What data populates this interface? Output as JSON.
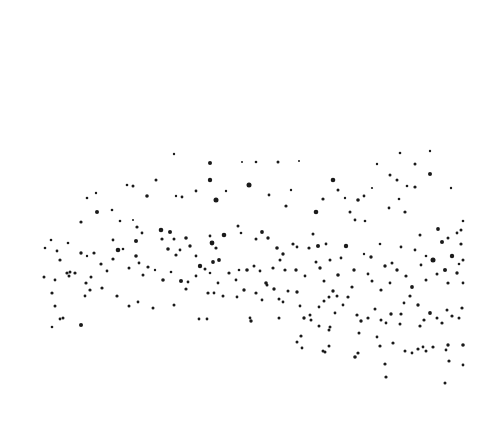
{
  "image": {
    "width": 482,
    "height": 431,
    "background": "#ffffff",
    "dot_color": "#1a1a1a",
    "description": "Scattered black dots forming an arched band across a white field"
  },
  "dots": [
    [
      174,
      154,
      1.2
    ],
    [
      210,
      163,
      2
    ],
    [
      242,
      162,
      1
    ],
    [
      256,
      162,
      1.3
    ],
    [
      278,
      162,
      1.5
    ],
    [
      299,
      161,
      1
    ],
    [
      210,
      180,
      2.2
    ],
    [
      249,
      185,
      2.5
    ],
    [
      226,
      191,
      1.2
    ],
    [
      156,
      180,
      1.5
    ],
    [
      127,
      185,
      1.3
    ],
    [
      133,
      186,
      1.5
    ],
    [
      147,
      196,
      1.8
    ],
    [
      176,
      196,
      1.2
    ],
    [
      182,
      197,
      1.4
    ],
    [
      216,
      200,
      2.5
    ],
    [
      269,
      195,
      1.4
    ],
    [
      291,
      190,
      1.2
    ],
    [
      196,
      191,
      1.4
    ],
    [
      286,
      206,
      1.6
    ],
    [
      316,
      212,
      2.3
    ],
    [
      323,
      199,
      1.6
    ],
    [
      358,
      200,
      1.8
    ],
    [
      389,
      208,
      1.4
    ],
    [
      399,
      199,
      1.3
    ],
    [
      405,
      212,
      1.6
    ],
    [
      415,
      187,
      1.6
    ],
    [
      397,
      180,
      1.5
    ],
    [
      390,
      175,
      1.5
    ],
    [
      415,
      164,
      1.5
    ],
    [
      430,
      174,
      2
    ],
    [
      451,
      188,
      1.2
    ],
    [
      463,
      221,
      1.3
    ],
    [
      461,
      230,
      1.5
    ],
    [
      372,
      188,
      1.1
    ],
    [
      364,
      196,
      1.4
    ],
    [
      350,
      212,
      1.5
    ],
    [
      355,
      220,
      1.4
    ],
    [
      365,
      221,
      1.3
    ],
    [
      333,
      180,
      2.3
    ],
    [
      338,
      190,
      1.5
    ],
    [
      345,
      198,
      1.2
    ],
    [
      400,
      153,
      1.3
    ],
    [
      407,
      186,
      1.3
    ],
    [
      430,
      151,
      1.2
    ],
    [
      377,
      164,
      1.2
    ],
    [
      96,
      193,
      1.2
    ],
    [
      87,
      198,
      1.3
    ],
    [
      97,
      212,
      2
    ],
    [
      81,
      222,
      1.6
    ],
    [
      68,
      243,
      1.3
    ],
    [
      51,
      240,
      1.3
    ],
    [
      45,
      248,
      1.3
    ],
    [
      57,
      251,
      1.4
    ],
    [
      60,
      260,
      1.6
    ],
    [
      67,
      273,
      1.6
    ],
    [
      70,
      272,
      1.5
    ],
    [
      81,
      253,
      1.7
    ],
    [
      87,
      256,
      1.2
    ],
    [
      94,
      253,
      1.6
    ],
    [
      112,
      210,
      1.3
    ],
    [
      120,
      221,
      1.3
    ],
    [
      133,
      220,
      1
    ],
    [
      137,
      227,
      1.6
    ],
    [
      136,
      241,
      2
    ],
    [
      142,
      233,
      1.4
    ],
    [
      113,
      240,
      1.4
    ],
    [
      118,
      250,
      2.3
    ],
    [
      123,
      249,
      1.3
    ],
    [
      136,
      256,
      1.8
    ],
    [
      161,
      230,
      2.3
    ],
    [
      170,
      232,
      2
    ],
    [
      162,
      239,
      1.6
    ],
    [
      174,
      239,
      1.5
    ],
    [
      168,
      249,
      1.8
    ],
    [
      176,
      255,
      1.6
    ],
    [
      180,
      250,
      1.4
    ],
    [
      186,
      238,
      1.8
    ],
    [
      190,
      246,
      1.7
    ],
    [
      210,
      236,
      1.4
    ],
    [
      212,
      243,
      2.4
    ],
    [
      216,
      248,
      1.6
    ],
    [
      219,
      260,
      1.9
    ],
    [
      213,
      262,
      1.9
    ],
    [
      196,
      256,
      1.4
    ],
    [
      200,
      266,
      2.2
    ],
    [
      224,
      235,
      2.3
    ],
    [
      238,
      226,
      1.5
    ],
    [
      241,
      233,
      1.3
    ],
    [
      256,
      239,
      1.5
    ],
    [
      262,
      232,
      1.9
    ],
    [
      268,
      238,
      1.7
    ],
    [
      277,
      248,
      1.8
    ],
    [
      283,
      254,
      1.7
    ],
    [
      293,
      244,
      1.6
    ],
    [
      297,
      247,
      1.4
    ],
    [
      309,
      248,
      1.6
    ],
    [
      313,
      234,
      1.5
    ],
    [
      318,
      246,
      2
    ],
    [
      326,
      244,
      1.4
    ],
    [
      346,
      246,
      2.2
    ],
    [
      341,
      258,
      1.4
    ],
    [
      364,
      254,
      1.2
    ],
    [
      371,
      257,
      1.7
    ],
    [
      385,
      266,
      1.7
    ],
    [
      392,
      263,
      1.5
    ],
    [
      380,
      244,
      1.3
    ],
    [
      401,
      247,
      1.4
    ],
    [
      438,
      229,
      1.9
    ],
    [
      442,
      242,
      2
    ],
    [
      448,
      238,
      1.5
    ],
    [
      457,
      233,
      1.4
    ],
    [
      433,
      260,
      2.5
    ],
    [
      445,
      270,
      2
    ],
    [
      459,
      264,
      1.3
    ],
    [
      461,
      244,
      1.6
    ],
    [
      452,
      256,
      2.2
    ],
    [
      463,
      260,
      1.5
    ],
    [
      420,
      235,
      1.5
    ],
    [
      415,
      250,
      1.4
    ],
    [
      426,
      256,
      1.3
    ],
    [
      421,
      265,
      1.4
    ],
    [
      44,
      277,
      1.5
    ],
    [
      55,
      280,
      1.4
    ],
    [
      69,
      276,
      1.5
    ],
    [
      75,
      273,
      1.6
    ],
    [
      86,
      283,
      1.6
    ],
    [
      91,
      277,
      1.5
    ],
    [
      101,
      264,
      1.6
    ],
    [
      107,
      271,
      1.4
    ],
    [
      113,
      259,
      1.6
    ],
    [
      129,
      268,
      1.5
    ],
    [
      139,
      263,
      1.4
    ],
    [
      143,
      275,
      1.5
    ],
    [
      148,
      267,
      1.6
    ],
    [
      155,
      270,
      1.2
    ],
    [
      163,
      280,
      1.8
    ],
    [
      171,
      272,
      1.3
    ],
    [
      181,
      281,
      2
    ],
    [
      188,
      282,
      1.4
    ],
    [
      196,
      276,
      1.4
    ],
    [
      205,
      269,
      1.5
    ],
    [
      210,
      273,
      1.3
    ],
    [
      218,
      283,
      1.4
    ],
    [
      229,
      273,
      1.6
    ],
    [
      236,
      280,
      1.4
    ],
    [
      239,
      270,
      1.3
    ],
    [
      247,
      270,
      1.8
    ],
    [
      254,
      266,
      1.5
    ],
    [
      260,
      271,
      1.4
    ],
    [
      266,
      283,
      1.8
    ],
    [
      273,
      268,
      1.6
    ],
    [
      280,
      260,
      1.5
    ],
    [
      285,
      270,
      1.6
    ],
    [
      296,
      270,
      1.7
    ],
    [
      305,
      276,
      1.4
    ],
    [
      316,
      262,
      1.5
    ],
    [
      320,
      268,
      1.7
    ],
    [
      324,
      281,
      1.5
    ],
    [
      330,
      260,
      1.5
    ],
    [
      338,
      275,
      1.8
    ],
    [
      352,
      287,
      1.6
    ],
    [
      354,
      270,
      1.7
    ],
    [
      368,
      274,
      1.4
    ],
    [
      372,
      281,
      1.5
    ],
    [
      381,
      290,
      1.6
    ],
    [
      390,
      283,
      1.4
    ],
    [
      397,
      270,
      1.7
    ],
    [
      406,
      276,
      1.6
    ],
    [
      412,
      287,
      1.9
    ],
    [
      426,
      280,
      1.5
    ],
    [
      437,
      274,
      1.5
    ],
    [
      448,
      283,
      1.6
    ],
    [
      457,
      273,
      1.7
    ],
    [
      463,
      283,
      1.4
    ],
    [
      52,
      293,
      1.6
    ],
    [
      55,
      306,
      1.5
    ],
    [
      60,
      319,
      1.4
    ],
    [
      63,
      318,
      1.5
    ],
    [
      52,
      327,
      1.3
    ],
    [
      81,
      325,
      2
    ],
    [
      85,
      296,
      1.4
    ],
    [
      90,
      290,
      1.6
    ],
    [
      102,
      288,
      1.6
    ],
    [
      117,
      296,
      1.6
    ],
    [
      129,
      306,
      1.5
    ],
    [
      138,
      302,
      1.4
    ],
    [
      153,
      308,
      1.5
    ],
    [
      174,
      305,
      1.5
    ],
    [
      186,
      289,
      1.6
    ],
    [
      199,
      319,
      1.4
    ],
    [
      207,
      319,
      1.4
    ],
    [
      208,
      293,
      1.6
    ],
    [
      214,
      293,
      1.4
    ],
    [
      223,
      296,
      1.5
    ],
    [
      237,
      297,
      1.4
    ],
    [
      244,
      290,
      1.7
    ],
    [
      251,
      321,
      1.7
    ],
    [
      256,
      293,
      1.6
    ],
    [
      262,
      300,
      1.4
    ],
    [
      267,
      285,
      1.5
    ],
    [
      274,
      289,
      1.7
    ],
    [
      279,
      299,
      1.5
    ],
    [
      288,
      291,
      1.5
    ],
    [
      297,
      292,
      1.7
    ],
    [
      300,
      306,
      1.4
    ],
    [
      304,
      318,
      1.7
    ],
    [
      310,
      315,
      1.5
    ],
    [
      319,
      307,
      1.4
    ],
    [
      324,
      301,
      1.5
    ],
    [
      329,
      297,
      1.5
    ],
    [
      333,
      291,
      1.7
    ],
    [
      337,
      296,
      1.5
    ],
    [
      343,
      305,
      1.4
    ],
    [
      348,
      297,
      1.6
    ],
    [
      357,
      315,
      1.6
    ],
    [
      361,
      321,
      1.7
    ],
    [
      368,
      318,
      1.6
    ],
    [
      375,
      309,
      1.5
    ],
    [
      381,
      320,
      1.5
    ],
    [
      386,
      323,
      1.4
    ],
    [
      391,
      314,
      1.7
    ],
    [
      401,
      314,
      1.6
    ],
    [
      404,
      303,
      1.4
    ],
    [
      410,
      296,
      1.6
    ],
    [
      418,
      305,
      1.7
    ],
    [
      420,
      326,
      1.6
    ],
    [
      424,
      320,
      1.6
    ],
    [
      430,
      313,
      1.9
    ],
    [
      437,
      318,
      1.5
    ],
    [
      442,
      323,
      1.6
    ],
    [
      447,
      310,
      1.5
    ],
    [
      452,
      316,
      1.6
    ],
    [
      459,
      318,
      1.5
    ],
    [
      462,
      308,
      1.6
    ],
    [
      400,
      324,
      1.5
    ],
    [
      393,
      343,
      1.6
    ],
    [
      380,
      346,
      1.6
    ],
    [
      377,
      337,
      1.4
    ],
    [
      359,
      333,
      1.5
    ],
    [
      358,
      353,
      1.6
    ],
    [
      335,
      313,
      1.4
    ],
    [
      329,
      346,
      1.5
    ],
    [
      323,
      351,
      1.5
    ],
    [
      330,
      327,
      1.5
    ],
    [
      319,
      326,
      1.5
    ],
    [
      301,
      336,
      1.6
    ],
    [
      297,
      342,
      1.5
    ],
    [
      302,
      348,
      1.4
    ],
    [
      311,
      320,
      1.5
    ],
    [
      283,
      302,
      1.4
    ],
    [
      279,
      318,
      1.5
    ],
    [
      250,
      318,
      1.4
    ],
    [
      355,
      357,
      1.8
    ],
    [
      385,
      364,
      1.6
    ],
    [
      386,
      377,
      1.6
    ],
    [
      405,
      351,
      1.5
    ],
    [
      412,
      353,
      1.4
    ],
    [
      418,
      349,
      1.6
    ],
    [
      423,
      347,
      1.4
    ],
    [
      426,
      351,
      1.5
    ],
    [
      433,
      347,
      1.6
    ],
    [
      448,
      345,
      1.7
    ],
    [
      449,
      361,
      1.6
    ],
    [
      445,
      383,
      1.5
    ],
    [
      463,
      345,
      1.8
    ],
    [
      463,
      365,
      1.4
    ],
    [
      446,
      350,
      1.4
    ],
    [
      325,
      352,
      1.5
    ],
    [
      329,
      330,
      1.5
    ]
  ]
}
